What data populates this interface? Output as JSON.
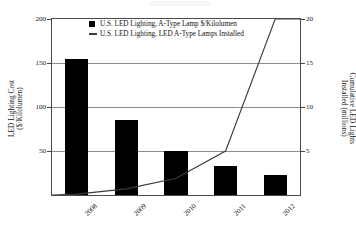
{
  "chart_data": {
    "type": "bar",
    "title": "",
    "subtitle": "",
    "categories": [
      "2008",
      "2009",
      "2010",
      "2011",
      "2012"
    ],
    "xlabel": "",
    "grid": true,
    "legend_position": "top-center",
    "series": [
      {
        "name": "U.S. LED Lighting, A-Type Lamp $/Kilolumen",
        "type": "bar",
        "axis": "left",
        "color": "#000000",
        "values": [
          155,
          85,
          50,
          33,
          23
        ]
      },
      {
        "name": "U.S. LED Lighting, LED A-Type Lamps Installed",
        "type": "line",
        "axis": "right",
        "color": "#3a3a3a",
        "values": [
          0.1,
          0.7,
          1.9,
          5.0,
          20.0
        ]
      }
    ],
    "left_axis": {
      "label_line1": "LED Lighting Cost",
      "label_line2": "($/Kilolumen)",
      "ticks": [
        0,
        50,
        100,
        150,
        200
      ],
      "tick_labels": [
        "",
        "50",
        "100",
        "150",
        "200"
      ],
      "ylim": [
        0,
        200
      ]
    },
    "right_axis": {
      "label_line1": "Cumulative LED Lights",
      "label_line2": "Installed (millions)",
      "ticks": [
        0,
        5,
        10,
        15,
        20
      ],
      "tick_labels": [
        "",
        "5",
        "10",
        "15",
        "20"
      ],
      "ylim": [
        0,
        20
      ]
    }
  },
  "legend": {
    "items": [
      {
        "label": "U.S. LED Lighting, A-Type Lamp $/Kilolumen",
        "marker": "square-swatch"
      },
      {
        "label": "U.S. LED Lighting, LED A-Type Lamps Installed",
        "marker": "line-swatch"
      }
    ]
  }
}
